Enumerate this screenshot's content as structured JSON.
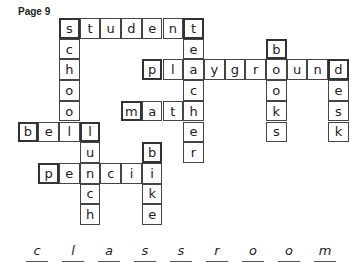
{
  "page_label": "Page 9",
  "grid": {
    "origin_x": 59,
    "origin_y": 18,
    "cell_size": 20.7,
    "words": [
      {
        "word": "student",
        "direction": "across",
        "row": 0,
        "col": 0
      },
      {
        "word": "school",
        "direction": "down",
        "row": 0,
        "col": 0
      },
      {
        "word": "teacher",
        "direction": "down",
        "row": 0,
        "col": 6
      },
      {
        "word": "books",
        "direction": "down",
        "row": 1,
        "col": 10
      },
      {
        "word": "playground",
        "direction": "across",
        "row": 2,
        "col": 4
      },
      {
        "word": "desk",
        "direction": "down",
        "row": 2,
        "col": 13
      },
      {
        "word": "math",
        "direction": "across",
        "row": 4,
        "col": 3
      },
      {
        "word": "bell",
        "direction": "across",
        "row": 5,
        "col": -2
      },
      {
        "word": "lunch",
        "direction": "down",
        "row": 5,
        "col": 1
      },
      {
        "word": "bike",
        "direction": "down",
        "row": 6,
        "col": 4
      },
      {
        "word": "pencil",
        "direction": "across",
        "row": 7,
        "col": -1
      }
    ]
  },
  "answer": {
    "word": "classroom",
    "letters": [
      "c",
      "l",
      "a",
      "s",
      "s",
      "r",
      "o",
      "o",
      "m"
    ]
  }
}
